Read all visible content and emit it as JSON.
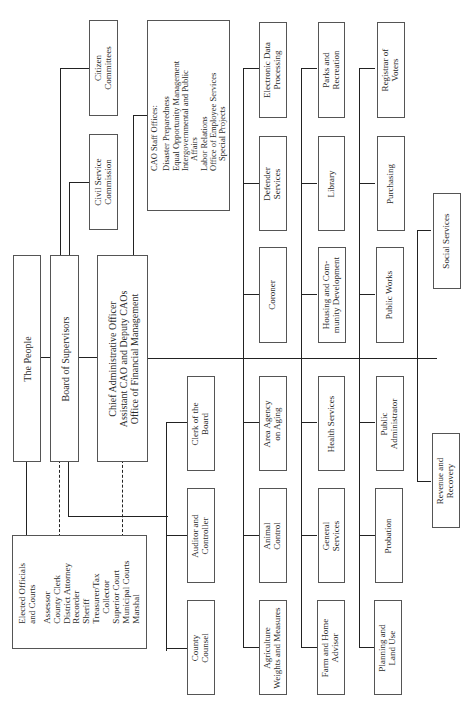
{
  "chart": {
    "orientation": "rotated-90-ccw",
    "root": "The People",
    "board": "Board of Supervisors",
    "cao": [
      "Chief Administrative Officer",
      "Assistant CAO and Deputy CAOs",
      "Office of Financial Management"
    ],
    "elected": {
      "title": [
        "Elected Officials",
        "and Courts"
      ],
      "items": [
        "Assessor",
        "County Clerk",
        "District Attorney",
        "Recorder",
        "Sheriff",
        "Treasurer/Tax",
        "Collector",
        "Superior Court",
        "Municipal Courts",
        "Marshal"
      ]
    },
    "board_direct": {
      "citizen_committees": [
        "Citizen",
        "Committees"
      ],
      "civil_service": [
        "Civil Service",
        "Commission"
      ],
      "clerk_board": [
        "Clerk of the",
        "Board"
      ],
      "auditor": [
        "Auditor and",
        "Controller"
      ],
      "county_counsel": [
        "County",
        "Counsel"
      ]
    },
    "cao_staff": {
      "title": "CAO Staff Offices:",
      "items": [
        "Disaster Preparedness",
        "Equal Opportunity Management",
        "Intergovernmental and Public",
        "Affairs",
        "Labor Relations",
        "Office of Employee Services",
        "Special Projects"
      ]
    },
    "departments": {
      "col1": [
        [
          "Electronic Data",
          "Processing"
        ],
        [
          "Defender",
          "Services"
        ],
        [
          "Coroner"
        ],
        [
          "Area Agency",
          "on Aging"
        ],
        [
          "Animal",
          "Control"
        ],
        [
          "Agriculture",
          "Weights and Measures"
        ]
      ],
      "col2": [
        [
          "Parks and",
          "Recreation"
        ],
        [
          "Library"
        ],
        [
          "Housing and Com-",
          "munity Development"
        ],
        [
          "Health Services"
        ],
        [
          "General",
          "Services"
        ],
        [
          "Farm and Home",
          "Advisor"
        ]
      ],
      "col3": [
        [
          "Registrar of",
          "Voters"
        ],
        [
          "Purchasing"
        ],
        [
          "Public Works"
        ],
        [
          "Public",
          "Administrator"
        ],
        [
          "Probation"
        ],
        [
          "Planning and",
          "Land Use"
        ]
      ],
      "col4": [
        [
          "Social Services"
        ],
        [
          "Revenue and",
          "Recovery"
        ]
      ]
    }
  }
}
